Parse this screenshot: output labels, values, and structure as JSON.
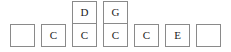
{
  "diagram": {
    "type": "box-row-diagram",
    "columns": 7,
    "rows": 2,
    "box_border_color": "#8a8a8a",
    "box_fill_color": "#ffffff",
    "text_color": "#1c1c1c",
    "background_color": "#ffffff",
    "top_row": [
      {
        "visible": false,
        "label": ""
      },
      {
        "visible": false,
        "label": ""
      },
      {
        "visible": true,
        "label": "D"
      },
      {
        "visible": true,
        "label": "G"
      },
      {
        "visible": false,
        "label": ""
      },
      {
        "visible": false,
        "label": ""
      },
      {
        "visible": false,
        "label": ""
      }
    ],
    "bottom_row": [
      {
        "visible": true,
        "label": ""
      },
      {
        "visible": true,
        "label": "C"
      },
      {
        "visible": true,
        "label": "C"
      },
      {
        "visible": true,
        "label": "C"
      },
      {
        "visible": true,
        "label": "C"
      },
      {
        "visible": true,
        "label": "E"
      },
      {
        "visible": true,
        "label": ""
      }
    ]
  }
}
